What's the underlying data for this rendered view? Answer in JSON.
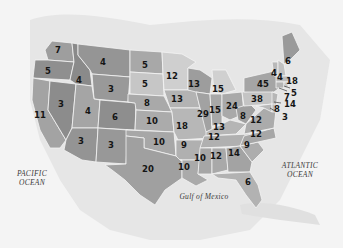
{
  "map": {
    "type": "us-electoral-votes",
    "background_color": "#f4f4f4",
    "state_color_dark": "#8f8f8f",
    "state_color_mid": "#a6a6a6",
    "state_color_light": "#c9c9c9",
    "land_color": "#e2e2e2",
    "water_labels": {
      "pacific": "PACIFIC\nOCEAN",
      "atlantic": "ATLANTIC\nOCEAN",
      "gulf": "Gulf of Mexico"
    },
    "states": [
      {
        "id": "WA",
        "value": "7"
      },
      {
        "id": "OR",
        "value": "5"
      },
      {
        "id": "CA",
        "value": "11"
      },
      {
        "id": "ID",
        "value": "4"
      },
      {
        "id": "NV",
        "value": "3"
      },
      {
        "id": "MT",
        "value": "4"
      },
      {
        "id": "WY",
        "value": "3"
      },
      {
        "id": "UT",
        "value": "4"
      },
      {
        "id": "AZ",
        "value": "3"
      },
      {
        "id": "CO",
        "value": "6"
      },
      {
        "id": "NM",
        "value": "3"
      },
      {
        "id": "ND",
        "value": "5"
      },
      {
        "id": "SD",
        "value": "5"
      },
      {
        "id": "NE",
        "value": "8"
      },
      {
        "id": "KS",
        "value": "10"
      },
      {
        "id": "OK",
        "value": "10"
      },
      {
        "id": "TX",
        "value": "20"
      },
      {
        "id": "MN",
        "value": "12"
      },
      {
        "id": "IA",
        "value": "13"
      },
      {
        "id": "MO",
        "value": "18"
      },
      {
        "id": "AR",
        "value": "9"
      },
      {
        "id": "LA",
        "value": "10"
      },
      {
        "id": "WI",
        "value": "13"
      },
      {
        "id": "IL",
        "value": "29"
      },
      {
        "id": "MI",
        "value": "15"
      },
      {
        "id": "IN",
        "value": "15"
      },
      {
        "id": "OH",
        "value": "24"
      },
      {
        "id": "KY",
        "value": "13"
      },
      {
        "id": "TN",
        "value": "12"
      },
      {
        "id": "MS",
        "value": "10"
      },
      {
        "id": "AL",
        "value": "12"
      },
      {
        "id": "GA",
        "value": "14"
      },
      {
        "id": "FL",
        "value": "6"
      },
      {
        "id": "SC",
        "value": "9"
      },
      {
        "id": "NC",
        "value": "12"
      },
      {
        "id": "VA",
        "value": "12"
      },
      {
        "id": "WV",
        "value": "8"
      },
      {
        "id": "PA",
        "value": "38"
      },
      {
        "id": "NY",
        "value": "45"
      },
      {
        "id": "VT",
        "value": "4"
      },
      {
        "id": "NH",
        "value": "4"
      },
      {
        "id": "ME",
        "value": "6"
      },
      {
        "id": "MA",
        "value": "18"
      },
      {
        "id": "RI",
        "value": "5"
      },
      {
        "id": "CT",
        "value": "7"
      },
      {
        "id": "NJ",
        "value": "14"
      },
      {
        "id": "MD",
        "value": "8"
      },
      {
        "id": "DE",
        "value": "3"
      }
    ]
  }
}
